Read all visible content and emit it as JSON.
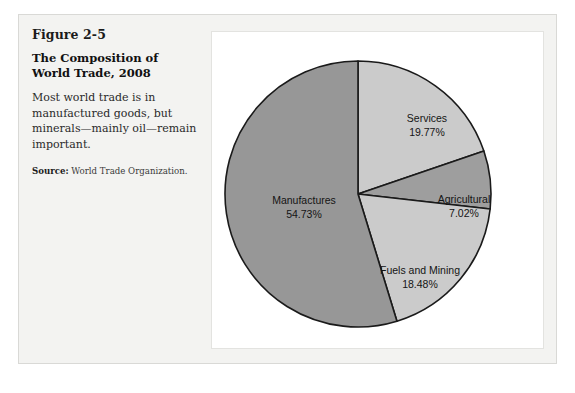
{
  "figure": {
    "number": "Figure 2-5",
    "title": "The Composition of World Trade, 2008",
    "body": "Most world trade is in manufactured goods, but minerals—mainly oil—remain important.",
    "source_label": "Source:",
    "source_text": " World Trade Organization."
  },
  "chart_data": {
    "type": "pie",
    "title": "The Composition of World Trade, 2008",
    "units": "percent",
    "start_angle_deg": 0,
    "direction": "clockwise",
    "legend": "none (labels placed inside slices)",
    "categories": [
      "Services",
      "Agricultural",
      "Fuels and Mining",
      "Manufactures"
    ],
    "values": [
      19.77,
      7.02,
      18.48,
      54.73
    ],
    "colors": [
      "#cbcbcb",
      "#9e9e9e",
      "#cbcbcb",
      "#979797"
    ],
    "slices": [
      {
        "name": "Services",
        "label": "Services",
        "value_label": "19.77%",
        "value": 19.77,
        "color": "#cbcbcb",
        "label_x": 215,
        "label_y": 90
      },
      {
        "name": "Agricultural",
        "label": "Agricultural",
        "value_label": "7.02%",
        "value": 7.02,
        "color": "#9e9e9e",
        "label_x": 252,
        "label_y": 171
      },
      {
        "name": "Fuels and Mining",
        "label": "Fuels and Mining",
        "value_label": "18.48%",
        "value": 18.48,
        "color": "#cbcbcb",
        "label_x": 208,
        "label_y": 242
      },
      {
        "name": "Manufactures",
        "label": "Manufactures",
        "value_label": "54.73%",
        "value": 54.73,
        "color": "#979797",
        "label_x": 92,
        "label_y": 172
      }
    ],
    "geometry": {
      "center_x": 146,
      "center_y": 162,
      "radius": 133,
      "stroke": "#1a1a1a",
      "stroke_width": 1.6
    }
  }
}
